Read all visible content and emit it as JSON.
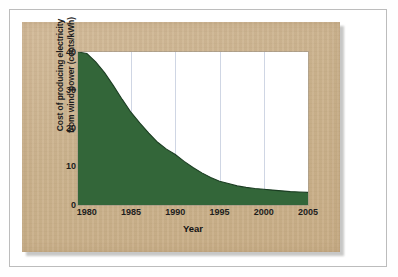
{
  "figure": {
    "background_color": "#cbb28d",
    "plot_background_color": "#ffffff",
    "series_color": "#336639",
    "gridline_color": "#cfd6e4",
    "page_border_color": "#bcbcbc"
  },
  "chart_data": {
    "type": "area",
    "title": "",
    "xlabel": "Year",
    "ylabel": "Cost of producing electricity from wind power (cents/kWh)",
    "ylabel_line1": "Cost of producing electricity",
    "ylabel_line2": "from wind power (cents/kWh)",
    "xlim": [
      1979,
      2005
    ],
    "ylim": [
      0,
      40
    ],
    "xticks": [
      1980,
      1985,
      1990,
      1995,
      2000,
      2005
    ],
    "xtick_labels": [
      "1980",
      "1985",
      "1990",
      "1995",
      "2000",
      "2005"
    ],
    "yticks": [
      0,
      10,
      20,
      30,
      40
    ],
    "ytick_labels": [
      "0",
      "10",
      "20",
      "30",
      "40"
    ],
    "grid": "vertical",
    "legend": "none",
    "fill_color": "#336639",
    "x": [
      1979,
      1980,
      1981,
      1982,
      1983,
      1984,
      1985,
      1986,
      1987,
      1988,
      1989,
      1990,
      1991,
      1992,
      1993,
      1994,
      1995,
      1996,
      1997,
      1998,
      1999,
      2000,
      2001,
      2002,
      2003,
      2004,
      2005
    ],
    "values": [
      40.0,
      39.6,
      37.4,
      34.6,
      31.2,
      27.6,
      24.2,
      21.4,
      18.8,
      16.4,
      14.6,
      13.2,
      11.4,
      9.8,
      8.4,
      7.2,
      6.2,
      5.6,
      5.0,
      4.6,
      4.3,
      4.1,
      3.9,
      3.7,
      3.5,
      3.4,
      3.3
    ],
    "annotations": []
  }
}
